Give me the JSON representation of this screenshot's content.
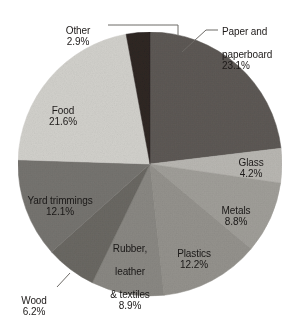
{
  "chart_data": {
    "type": "pie",
    "title": "",
    "subtitle": "",
    "xlabel": "",
    "ylabel": "",
    "legend_position": "none",
    "grid": false,
    "units": "percent",
    "start_angle_deg": 0,
    "direction": "clockwise",
    "categories": [
      "Paper and paperboard",
      "Glass",
      "Metals",
      "Plastics",
      "Rubber, leather & textiles",
      "Wood",
      "Yard trimmings",
      "Food",
      "Other"
    ],
    "values": [
      23.1,
      4.2,
      8.8,
      12.2,
      8.9,
      6.2,
      12.1,
      21.6,
      2.9
    ],
    "slices": [
      {
        "key": "paper",
        "label": "Paper and\npaperboard",
        "label_line1": "Paper and",
        "label_line2": "paperboard",
        "value": 23.1,
        "pct": "23.1%",
        "color": "#5d5955",
        "label_placement": "outside",
        "leader_line": true
      },
      {
        "key": "glass",
        "label": "Glass",
        "value": 4.2,
        "pct": "4.2%",
        "color": "#b9b7b2",
        "label_placement": "inside",
        "leader_line": false
      },
      {
        "key": "metals",
        "label": "Metals",
        "value": 8.8,
        "pct": "8.8%",
        "color": "#a09e99",
        "label_placement": "inside",
        "leader_line": false
      },
      {
        "key": "plastics",
        "label": "Plastics",
        "value": 12.2,
        "pct": "12.2%",
        "color": "#949views",
        "label_placement": "inside",
        "leader_line": false
      },
      {
        "key": "rubber",
        "label": "Rubber,\nleather\n& textiles",
        "label_line1": "Rubber,",
        "label_line2": "leather",
        "label_line3": "& textiles",
        "value": 8.9,
        "pct": "8.9%",
        "color": "#8a8883",
        "label_placement": "inside",
        "leader_line": false
      },
      {
        "key": "wood",
        "label": "Wood",
        "value": 6.2,
        "pct": "6.2%",
        "color": "#6a6863",
        "label_placement": "outside",
        "leader_line": true
      },
      {
        "key": "yard",
        "label": "Yard trimmings",
        "value": 12.1,
        "pct": "12.1%",
        "color": "#767470",
        "label_placement": "inside",
        "leader_line": false
      },
      {
        "key": "food",
        "label": "Food",
        "value": 21.6,
        "pct": "21.6%",
        "color": "#d2d1cc",
        "label_placement": "inside",
        "leader_line": false
      },
      {
        "key": "other",
        "label": "Other",
        "value": 2.9,
        "pct": "2.9%",
        "color": "#2e2624",
        "label_placement": "outside",
        "leader_line": true
      }
    ]
  },
  "geometry": {
    "center_x": 150,
    "center_y": 164,
    "radius": 132
  },
  "colors": {
    "background": "#ffffff",
    "leader_line": "#6d6a66",
    "label_dark": "#1d1a19",
    "label_light": "#efedea"
  }
}
